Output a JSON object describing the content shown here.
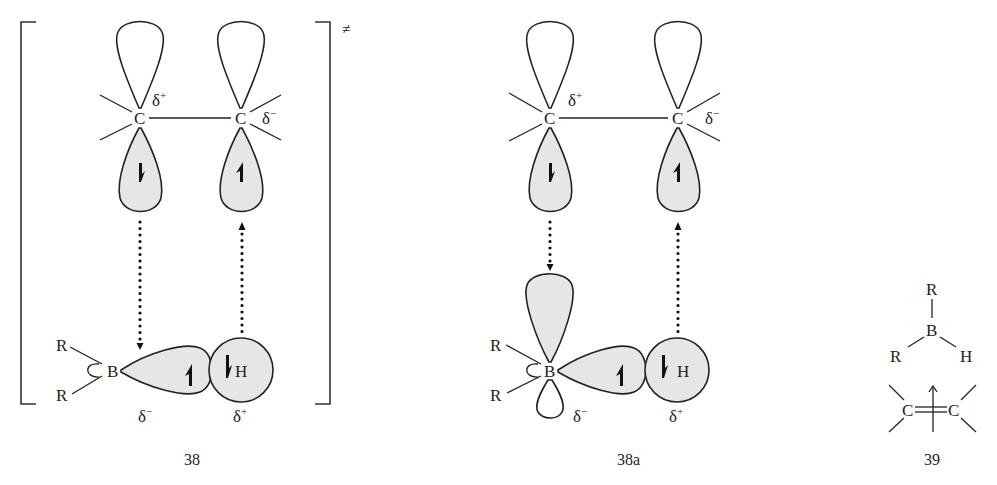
{
  "figure": {
    "structures": [
      {
        "id": "38",
        "label": "38",
        "transition_state_mark": "≠",
        "atoms": {
          "c1": "C",
          "c2": "C",
          "b": "B",
          "h": "H",
          "r1": "R",
          "r2": "R"
        },
        "charges": {
          "c1": "δ",
          "c1_sign": "+",
          "c2": "δ",
          "c2_sign": "−",
          "b": "δ",
          "b_sign": "−",
          "h": "δ",
          "h_sign": "+"
        }
      },
      {
        "id": "38a",
        "label": "38a",
        "atoms": {
          "c1": "C",
          "c2": "C",
          "b": "B",
          "h": "H",
          "r1": "R",
          "r2": "R"
        },
        "charges": {
          "c1": "δ",
          "c1_sign": "+",
          "c2": "δ",
          "c2_sign": "−",
          "b": "δ",
          "b_sign": "−",
          "h": "δ",
          "h_sign": "+"
        }
      },
      {
        "id": "39",
        "label": "39",
        "atoms": {
          "r_top": "R",
          "b": "B",
          "r_left": "R",
          "h": "H",
          "c1": "C",
          "c2": "C"
        }
      }
    ],
    "colors": {
      "orbital_fill": "#e6e6e6",
      "line": "#222222"
    }
  }
}
